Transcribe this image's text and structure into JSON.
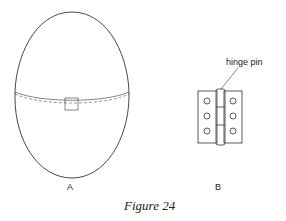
{
  "figure": {
    "caption": "Figure 24",
    "panel_a_label": "A",
    "panel_b_label": "B",
    "hinge_annotation": "hinge pin"
  },
  "colors": {
    "line": "#333333",
    "background": "#ffffff"
  }
}
